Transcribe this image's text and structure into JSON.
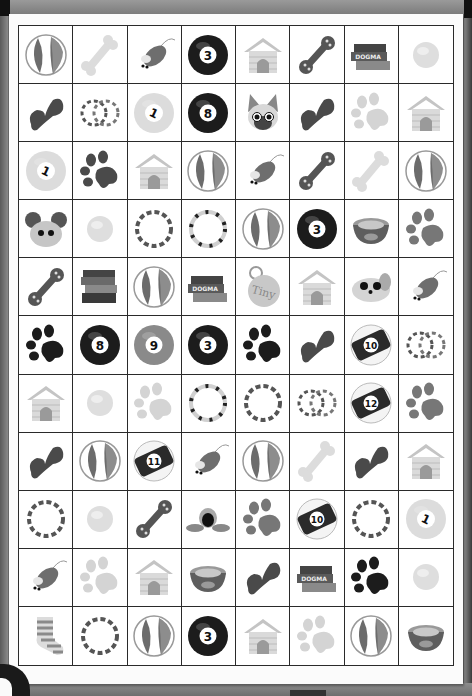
{
  "game": {
    "title": "Pet item memory match board",
    "columns": 8,
    "rows": 11,
    "grid": [
      [
        "beach-ball",
        "bone",
        "toy-mouse",
        "pool-ball-3",
        "doghouse",
        "chew-toy-dumbbell",
        "books",
        "tennis-ball"
      ],
      [
        "bowtie-toy",
        "double-rings",
        "pool-ball-1",
        "pool-ball-8",
        "cat-face",
        "bowtie-toy",
        "paw-print-light",
        "doghouse"
      ],
      [
        "pool-ball-1",
        "paw-print-dark",
        "doghouse",
        "beach-ball",
        "toy-mouse",
        "chew-toy-dumbbell",
        "bone",
        "beach-ball"
      ],
      [
        "hamster-face",
        "tennis-ball",
        "ring",
        "ring-striped",
        "beach-ball",
        "pool-ball-3",
        "pet-bowl",
        "paw-print"
      ],
      [
        "chew-toy-dumbbell",
        "books-stack",
        "beach-ball",
        "books",
        "name-tag-tiny",
        "doghouse",
        "puppy-face",
        "toy-mouse"
      ],
      [
        "paw-print-black",
        "pool-ball-8",
        "pool-ball-9",
        "pool-ball-3",
        "paw-print-black",
        "bowtie-toy",
        "pool-ball-10",
        "double-rings"
      ],
      [
        "doghouse",
        "tennis-ball",
        "paw-print-light",
        "ring-striped",
        "ring",
        "double-rings",
        "pool-ball-12",
        "paw-print"
      ],
      [
        "bowtie-toy",
        "beach-ball",
        "pool-ball-11",
        "toy-mouse",
        "beach-ball",
        "bone",
        "bowtie-toy",
        "doghouse"
      ],
      [
        "ring",
        "tennis-ball",
        "chew-toy-dumbbell",
        "squeaky-duck",
        "paw-print",
        "pool-ball-10",
        "ring",
        "pool-ball-1"
      ],
      [
        "toy-mouse",
        "paw-print-light",
        "doghouse",
        "pet-bowl",
        "bowtie-toy",
        "books",
        "paw-print-black",
        "tennis-ball"
      ],
      [
        "striped-sock",
        "ring",
        "beach-ball",
        "pool-ball-3",
        "doghouse",
        "paw-print-light",
        "beach-ball",
        "pet-bowl"
      ]
    ],
    "labels": {
      "books": "DOGMA",
      "name_tag": "Tiny",
      "ball_numbers": {
        "pool-ball-1": "1",
        "pool-ball-3": "3",
        "pool-ball-8": "8",
        "pool-ball-9": "9",
        "pool-ball-10": "10",
        "pool-ball-11": "11",
        "pool-ball-12": "12"
      }
    },
    "colors": {
      "paper": "#fbfbfb",
      "grid_line": "#2a2a2a",
      "frame": "#7c7c7c",
      "icon_dark": "#1e1e1e",
      "icon_mid": "#707070",
      "icon_light": "#c8c8c8"
    }
  }
}
